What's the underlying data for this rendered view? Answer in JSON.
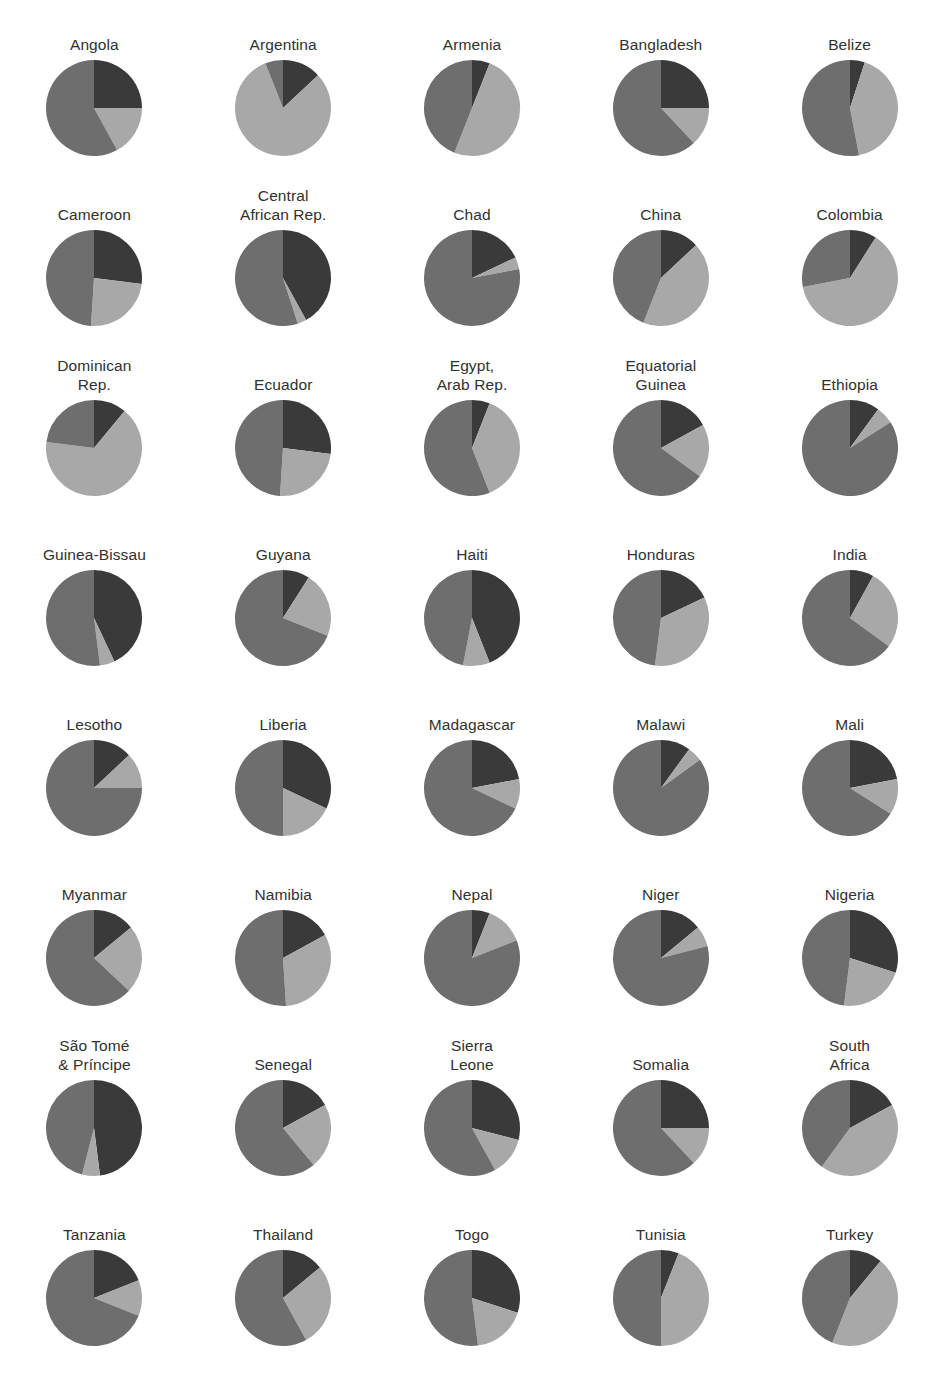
{
  "figure": {
    "top_note": "",
    "colors": {
      "dark": "#3a3a3a",
      "medium": "#6e6e6e",
      "light": "#a8a8a8",
      "background": "#ffffff",
      "label": "#31312f"
    }
  },
  "chart_data": {
    "type": "pie",
    "title": "",
    "subtitle": "",
    "xlabel": "",
    "ylabel": "",
    "legend_position": "none",
    "grid": false,
    "note": "Small-multiples grid of 3-slice pie charts, one per country. Slices begin at 12 o'clock and proceed clockwise in the order dark, light, medium. Values are percentage shares estimated from slice arc angles.",
    "slice_order": [
      "dark",
      "light",
      "medium"
    ],
    "series": [
      {
        "name": "dark",
        "color": "#3a3a3a"
      },
      {
        "name": "light",
        "color": "#a8a8a8"
      },
      {
        "name": "medium",
        "color": "#6e6e6e"
      }
    ],
    "columns": 5,
    "rows": 8,
    "categories": [
      "Angola",
      "Argentina",
      "Armenia",
      "Bangladesh",
      "Belize",
      "Cameroon",
      "Central African Rep.",
      "Chad",
      "China",
      "Colombia",
      "Dominican Rep.",
      "Ecuador",
      "Egypt, Arab Rep.",
      "Equatorial Guinea",
      "Ethiopia",
      "Guinea-Bissau",
      "Guyana",
      "Haiti",
      "Honduras",
      "India",
      "Lesotho",
      "Liberia",
      "Madagascar",
      "Malawi",
      "Mali",
      "Myanmar",
      "Namibia",
      "Nepal",
      "Niger",
      "Nigeria",
      "São Tomé & Príncipe",
      "Senegal",
      "Sierra Leone",
      "Somalia",
      "South Africa",
      "Tanzania",
      "Thailand",
      "Togo",
      "Tunisia",
      "Turkey"
    ],
    "panels": [
      {
        "label": "Angola",
        "label_lines": [
          "Angola"
        ],
        "values": [
          25,
          17,
          58
        ]
      },
      {
        "label": "Argentina",
        "label_lines": [
          "Argentina"
        ],
        "values": [
          13,
          81,
          6
        ]
      },
      {
        "label": "Armenia",
        "label_lines": [
          "Armenia"
        ],
        "values": [
          6,
          50,
          44
        ]
      },
      {
        "label": "Bangladesh",
        "label_lines": [
          "Bangladesh"
        ],
        "values": [
          25,
          13,
          62
        ]
      },
      {
        "label": "Belize",
        "label_lines": [
          "Belize"
        ],
        "values": [
          5,
          42,
          53
        ]
      },
      {
        "label": "Cameroon",
        "label_lines": [
          "Cameroon"
        ],
        "values": [
          27,
          24,
          49
        ]
      },
      {
        "label": "Central African Rep.",
        "label_lines": [
          "Central",
          "African Rep."
        ],
        "values": [
          42,
          3,
          55
        ]
      },
      {
        "label": "Chad",
        "label_lines": [
          "Chad"
        ],
        "values": [
          18,
          4,
          78
        ]
      },
      {
        "label": "China",
        "label_lines": [
          "China"
        ],
        "values": [
          13,
          43,
          44
        ]
      },
      {
        "label": "Colombia",
        "label_lines": [
          "Colombia"
        ],
        "values": [
          9,
          63,
          28
        ]
      },
      {
        "label": "Dominican Rep.",
        "label_lines": [
          "Dominican",
          "Rep."
        ],
        "values": [
          11,
          66,
          23
        ]
      },
      {
        "label": "Ecuador",
        "label_lines": [
          "Ecuador"
        ],
        "values": [
          27,
          24,
          49
        ]
      },
      {
        "label": "Egypt, Arab Rep.",
        "label_lines": [
          "Egypt,",
          "Arab Rep."
        ],
        "values": [
          6,
          38,
          56
        ]
      },
      {
        "label": "Equatorial Guinea",
        "label_lines": [
          "Equatorial",
          "Guinea"
        ],
        "values": [
          17,
          18,
          65
        ]
      },
      {
        "label": "Ethiopia",
        "label_lines": [
          "Ethiopia"
        ],
        "values": [
          10,
          6,
          84
        ]
      },
      {
        "label": "Guinea-Bissau",
        "label_lines": [
          "Guinea-Bissau"
        ],
        "values": [
          43,
          5,
          52
        ]
      },
      {
        "label": "Guyana",
        "label_lines": [
          "Guyana"
        ],
        "values": [
          9,
          22,
          69
        ]
      },
      {
        "label": "Haiti",
        "label_lines": [
          "Haiti"
        ],
        "values": [
          44,
          9,
          47
        ]
      },
      {
        "label": "Honduras",
        "label_lines": [
          "Honduras"
        ],
        "values": [
          18,
          34,
          48
        ]
      },
      {
        "label": "India",
        "label_lines": [
          "India"
        ],
        "values": [
          8,
          27,
          65
        ]
      },
      {
        "label": "Lesotho",
        "label_lines": [
          "Lesotho"
        ],
        "values": [
          13,
          12,
          75
        ]
      },
      {
        "label": "Liberia",
        "label_lines": [
          "Liberia"
        ],
        "values": [
          32,
          18,
          50
        ]
      },
      {
        "label": "Madagascar",
        "label_lines": [
          "Madagascar"
        ],
        "values": [
          22,
          10,
          68
        ]
      },
      {
        "label": "Malawi",
        "label_lines": [
          "Malawi"
        ],
        "values": [
          10,
          5,
          85
        ]
      },
      {
        "label": "Mali",
        "label_lines": [
          "Mali"
        ],
        "values": [
          22,
          12,
          66
        ]
      },
      {
        "label": "Myanmar",
        "label_lines": [
          "Myanmar"
        ],
        "values": [
          14,
          23,
          63
        ]
      },
      {
        "label": "Namibia",
        "label_lines": [
          "Namibia"
        ],
        "values": [
          17,
          32,
          51
        ]
      },
      {
        "label": "Nepal",
        "label_lines": [
          "Nepal"
        ],
        "values": [
          6,
          13,
          81
        ]
      },
      {
        "label": "Niger",
        "label_lines": [
          "Niger"
        ],
        "values": [
          14,
          7,
          79
        ]
      },
      {
        "label": "Nigeria",
        "label_lines": [
          "Nigeria"
        ],
        "values": [
          30,
          22,
          48
        ]
      },
      {
        "label": "São Tomé & Príncipe",
        "label_lines": [
          "São Tomé",
          "& Príncipe"
        ],
        "values": [
          48,
          6,
          46
        ]
      },
      {
        "label": "Senegal",
        "label_lines": [
          "Senegal"
        ],
        "values": [
          17,
          22,
          61
        ]
      },
      {
        "label": "Sierra Leone",
        "label_lines": [
          "Sierra",
          "Leone"
        ],
        "values": [
          29,
          13,
          58
        ]
      },
      {
        "label": "Somalia",
        "label_lines": [
          "Somalia"
        ],
        "values": [
          25,
          13,
          62
        ]
      },
      {
        "label": "South Africa",
        "label_lines": [
          "South",
          "Africa"
        ],
        "values": [
          17,
          43,
          40
        ]
      },
      {
        "label": "Tanzania",
        "label_lines": [
          "Tanzania"
        ],
        "values": [
          19,
          12,
          69
        ]
      },
      {
        "label": "Thailand",
        "label_lines": [
          "Thailand"
        ],
        "values": [
          14,
          28,
          58
        ]
      },
      {
        "label": "Togo",
        "label_lines": [
          "Togo"
        ],
        "values": [
          30,
          18,
          52
        ]
      },
      {
        "label": "Tunisia",
        "label_lines": [
          "Tunisia"
        ],
        "values": [
          6,
          44,
          50
        ]
      },
      {
        "label": "Turkey",
        "label_lines": [
          "Turkey"
        ],
        "values": [
          11,
          45,
          44
        ]
      }
    ]
  }
}
